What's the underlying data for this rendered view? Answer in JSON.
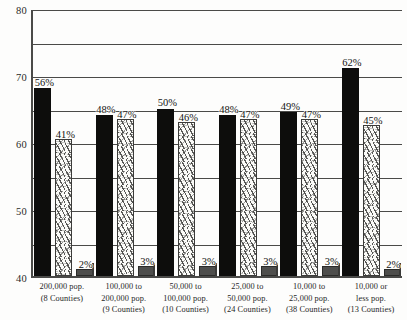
{
  "chart_data": {
    "type": "bar",
    "title": "",
    "subtitle": "",
    "xlabel": "",
    "ylabel": "",
    "ylim": [
      0,
      80
    ],
    "yticks": [
      0,
      10,
      20,
      30,
      40,
      50,
      60,
      70,
      80
    ],
    "ytick_labels": [
      "0",
      "10",
      "20",
      "30",
      "40",
      "50",
      "60",
      "70",
      "80"
    ],
    "grid": true,
    "legend": "none",
    "categories": [
      "200,000 pop.\n(8 Counties)",
      "100,000 to 200,000 pop.\n(9 Counties)",
      "50,000 to 100,000 pop.\n(10 Counties)",
      "25,000 to 50,000 pop.\n(24 Counties)",
      "10,000 to 25,000 pop.\n(38 Counties)",
      "10,000 or less pop.\n(13 Counties)"
    ],
    "category_lines": [
      [
        "200,000 pop.",
        "(8 Counties)"
      ],
      [
        "100,000 to",
        "200,000 pop.",
        "(9 Counties)"
      ],
      [
        "50,000 to",
        "100,000 pop.",
        "(10 Counties)"
      ],
      [
        "25,000 to",
        "50,000 pop.",
        "(24 Counties)"
      ],
      [
        "10,000 to",
        "25,000 pop.",
        "(38 Counties)"
      ],
      [
        "10,000 or",
        "less pop.",
        "(13 Counties)"
      ]
    ],
    "series": [
      {
        "name": "series-1",
        "color": "#0d0d0c",
        "values": [
          56,
          48,
          50,
          48,
          49,
          62
        ],
        "labels": [
          "56%",
          "48%",
          "50%",
          "48%",
          "49%",
          "62%"
        ]
      },
      {
        "name": "series-2",
        "color": "#fbfbf8",
        "values": [
          41,
          47,
          46,
          47,
          47,
          45
        ],
        "labels": [
          "41%",
          "47%",
          "46%",
          "47%",
          "47%",
          "45%"
        ]
      },
      {
        "name": "series-3",
        "color": "#4e4e4c",
        "values": [
          2,
          3,
          3,
          3,
          3,
          2
        ],
        "labels": [
          "2%",
          "3%",
          "3%",
          "3%",
          "3%",
          "2%"
        ]
      }
    ],
    "axis_color": "#4a4a48",
    "background_color": "#fdfdfc"
  }
}
